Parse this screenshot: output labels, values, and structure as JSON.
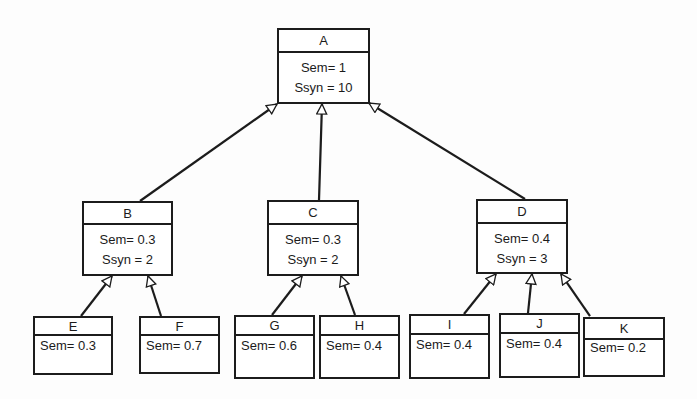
{
  "diagram": {
    "type": "tree",
    "edge_style": "hollow-triangle arrow pointing from child to parent",
    "colors": {
      "stroke": "#1c1c1c",
      "box_fill": "#ffffff",
      "background": "#fdfdfd"
    },
    "nodes": {
      "A": {
        "label": "A",
        "sem": "Sem= 1",
        "ssyn": "Ssyn = 10"
      },
      "B": {
        "label": "B",
        "sem": "Sem= 0.3",
        "ssyn": "Ssyn = 2"
      },
      "C": {
        "label": "C",
        "sem": "Sem= 0.3",
        "ssyn": "Ssyn = 2"
      },
      "D": {
        "label": "D",
        "sem": "Sem= 0.4",
        "ssyn": "Ssyn = 3"
      },
      "E": {
        "label": "E",
        "sem": "Sem= 0.3"
      },
      "F": {
        "label": "F",
        "sem": "Sem= 0.7"
      },
      "G": {
        "label": "G",
        "sem": "Sem= 0.6"
      },
      "H": {
        "label": "H",
        "sem": "Sem= 0.4"
      },
      "I": {
        "label": "I",
        "sem": "Sem= 0.4"
      },
      "J": {
        "label": "J",
        "sem": "Sem= 0.4"
      },
      "K": {
        "label": "K",
        "sem": "Sem= 0.2"
      }
    },
    "edges": [
      {
        "from": "B",
        "to": "A"
      },
      {
        "from": "C",
        "to": "A"
      },
      {
        "from": "D",
        "to": "A"
      },
      {
        "from": "E",
        "to": "B"
      },
      {
        "from": "F",
        "to": "B"
      },
      {
        "from": "G",
        "to": "C"
      },
      {
        "from": "H",
        "to": "C"
      },
      {
        "from": "I",
        "to": "D"
      },
      {
        "from": "J",
        "to": "D"
      },
      {
        "from": "K",
        "to": "D"
      }
    ]
  }
}
